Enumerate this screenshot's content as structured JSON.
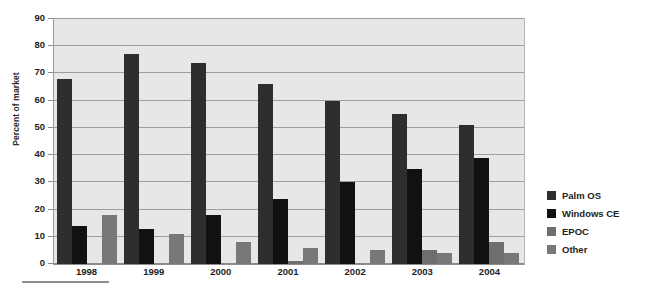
{
  "chart_data": {
    "type": "bar",
    "title": "",
    "subtitle": "",
    "xlabel": "",
    "ylabel": "Percent of market",
    "categories": [
      "1998",
      "1999",
      "2000",
      "2001",
      "2002",
      "2003",
      "2004"
    ],
    "series": [
      {
        "name": "Palm OS",
        "color": "#2e2e2e",
        "values": [
          68,
          77,
          74,
          66,
          60,
          55,
          51
        ]
      },
      {
        "name": "Windows CE",
        "color": "#111111",
        "values": [
          14,
          13,
          18,
          24,
          30,
          35,
          39
        ]
      },
      {
        "name": "EPOC",
        "color": "#6e6e6e",
        "values": [
          0,
          0,
          0,
          1,
          0,
          5,
          8
        ]
      },
      {
        "name": "Other",
        "color": "#787878",
        "values": [
          18,
          11,
          8,
          6,
          5,
          4,
          4
        ]
      }
    ],
    "ylim": [
      0,
      90
    ],
    "ytick_values": [
      0,
      10,
      20,
      30,
      40,
      50,
      60,
      70,
      80,
      90
    ],
    "ytick_labels": [
      "0",
      "10",
      "20",
      "30",
      "40",
      "50",
      "60",
      "70",
      "80",
      "90"
    ],
    "grid": true,
    "grid_color": "#9d9d9d",
    "plot_background": "#e7e7e7",
    "legend_position": "right",
    "legend_entries": [
      {
        "label": "Palm OS",
        "color": "#2e2e2e"
      },
      {
        "label": "Windows CE",
        "color": "#111111"
      },
      {
        "label": "EPOC",
        "color": "#6e6e6e"
      },
      {
        "label": "Other",
        "color": "#787878"
      }
    ]
  }
}
